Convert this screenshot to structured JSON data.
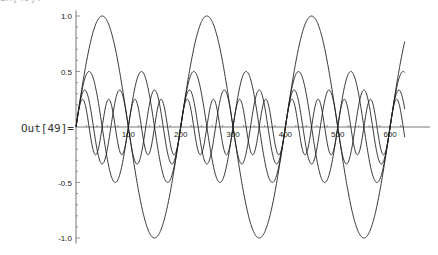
{
  "cell": {
    "output_label": "Out[49]=",
    "input_label_clipped": "In[49]:="
  },
  "chart_data": {
    "type": "line",
    "title": "",
    "xlabel": "",
    "ylabel": "",
    "xlim": [
      0,
      628
    ],
    "ylim": [
      -1.0,
      1.0
    ],
    "grid": false,
    "legend": "none",
    "x_ticks": [
      100,
      200,
      300,
      400,
      500,
      600
    ],
    "y_ticks": [
      -1.0,
      -0.5,
      0.5,
      1.0
    ],
    "x_tick_labels": [
      "100",
      "200",
      "300",
      "400",
      "500",
      "600"
    ],
    "y_tick_labels": [
      "-1.0",
      "-0.5",
      "0.5",
      "1.0"
    ],
    "series": [
      {
        "name": "sin(pi x/100)",
        "amplitude": 1.0,
        "period": 200,
        "color": "#222222"
      },
      {
        "name": "sin(2 pi x/100)/2",
        "amplitude": 0.5,
        "period": 100,
        "color": "#222222"
      },
      {
        "name": "sin(3 pi x/100)/3",
        "amplitude": 0.333,
        "period": 66.7,
        "color": "#222222"
      },
      {
        "name": "sin(4 pi x/100)/4",
        "amplitude": 0.25,
        "period": 50,
        "color": "#222222"
      }
    ]
  },
  "layout": {
    "x0_px": 76,
    "x_scale": 0.5235,
    "y0_px": 127,
    "y_scale": 111
  }
}
